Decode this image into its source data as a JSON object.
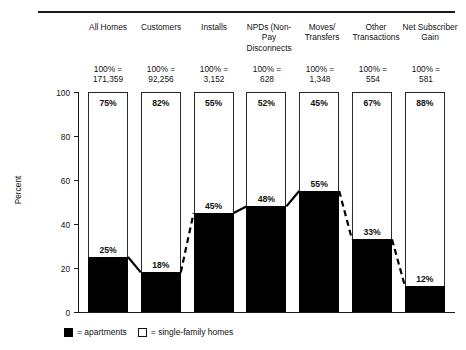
{
  "chart_data": {
    "type": "bar",
    "title": "",
    "xlabel": "",
    "ylabel": "Percent",
    "ylim": [
      0,
      100
    ],
    "yticks": [
      0,
      20,
      40,
      60,
      80,
      100
    ],
    "grid": false,
    "stacked": true,
    "legend_position": "bottom-left",
    "categories": [
      "All Homes",
      "Customers",
      "Installs",
      "NPDs (Non-Pay Disconnects",
      "Moves/ Transfers",
      "Other Transactions",
      "Net Subscriber Gain"
    ],
    "category_lines": [
      [
        "All",
        "Homes"
      ],
      [
        "Customers"
      ],
      [
        "Installs"
      ],
      [
        "NPDs",
        "(Non-Pay",
        "Disconnects"
      ],
      [
        "Moves/",
        "Transfers"
      ],
      [
        "Other",
        "Transactions"
      ],
      [
        "Net",
        "Subscriber",
        "Gain"
      ]
    ],
    "base_totals": [
      [
        "100% =",
        "171,359"
      ],
      [
        "100% =",
        "92,256"
      ],
      [
        "100% =",
        "3,152"
      ],
      [
        "100% =",
        "628"
      ],
      [
        "100% =",
        "1,348"
      ],
      [
        "100% =",
        "554"
      ],
      [
        "100% =",
        "581"
      ]
    ],
    "totals_values": [
      171359,
      92256,
      3152,
      628,
      1348,
      554,
      581
    ],
    "series": [
      {
        "name": "apartments",
        "color": "#000000",
        "values": [
          25,
          18,
          45,
          48,
          55,
          33,
          12
        ],
        "labels": [
          "25%",
          "18%",
          "45%",
          "48%",
          "55%",
          "33%",
          "12%"
        ]
      },
      {
        "name": "single-family homes",
        "color": "#ffffff",
        "values": [
          75,
          82,
          55,
          52,
          45,
          67,
          88
        ],
        "labels": [
          "75%",
          "82%",
          "55%",
          "52%",
          "45%",
          "67%",
          "88%"
        ]
      }
    ],
    "trend_line": {
      "name": "apartment share trend",
      "values": [
        25,
        18,
        45,
        48,
        55,
        33,
        12
      ],
      "segment_styles": [
        "solid",
        "dashed",
        "solid",
        "solid",
        "dashed",
        "dashed"
      ]
    }
  },
  "legend": {
    "items": [
      {
        "swatch": "black-square-icon",
        "text": "= apartments"
      },
      {
        "swatch": "white-square-icon",
        "text": "= single-family homes"
      }
    ]
  },
  "axis": {
    "y_title": "Percent",
    "y_tick_labels": [
      "100",
      "80",
      "60",
      "40",
      "20",
      "0"
    ]
  }
}
